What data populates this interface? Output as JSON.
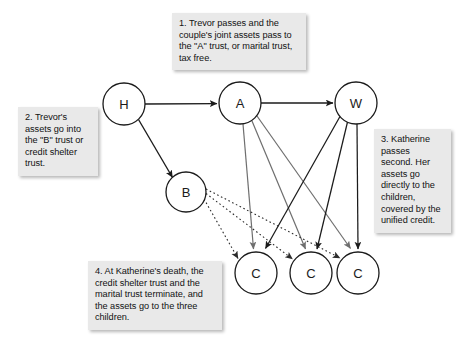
{
  "diagram": {
    "type": "flow-diagram",
    "background_color": "#ffffff",
    "node_fill": "#ffffff",
    "node_stroke": "#1b1b1b",
    "callout_fill": "#e9e9e9",
    "callout_text_color": "#121212",
    "nodes": [
      {
        "id": "H",
        "label": "H",
        "cx": 124,
        "cy": 104,
        "r": 21
      },
      {
        "id": "A",
        "label": "A",
        "cx": 240,
        "cy": 103,
        "r": 21
      },
      {
        "id": "W",
        "label": "W",
        "cx": 356,
        "cy": 103,
        "r": 21
      },
      {
        "id": "B",
        "label": "B",
        "cx": 186,
        "cy": 192,
        "r": 20
      },
      {
        "id": "C1",
        "label": "C",
        "cx": 256,
        "cy": 273,
        "r": 21
      },
      {
        "id": "C2",
        "label": "C",
        "cx": 311,
        "cy": 273,
        "r": 21
      },
      {
        "id": "C3",
        "label": "C",
        "cx": 358,
        "cy": 273,
        "r": 21
      }
    ],
    "edges": [
      {
        "from": "H",
        "to": "A",
        "style": "solid",
        "color": "#1b1b1b"
      },
      {
        "from": "A",
        "to": "W",
        "style": "solid",
        "color": "#1b1b1b"
      },
      {
        "from": "H",
        "to": "B",
        "style": "solid",
        "color": "#1b1b1b"
      },
      {
        "from": "A",
        "to": "C1",
        "style": "solid",
        "color": "#6e6e6e"
      },
      {
        "from": "A",
        "to": "C2",
        "style": "solid",
        "color": "#6e6e6e"
      },
      {
        "from": "A",
        "to": "C3",
        "style": "solid",
        "color": "#6e6e6e"
      },
      {
        "from": "W",
        "to": "C1",
        "style": "solid",
        "color": "#1b1b1b"
      },
      {
        "from": "W",
        "to": "C2",
        "style": "solid",
        "color": "#1b1b1b"
      },
      {
        "from": "W",
        "to": "C3",
        "style": "solid",
        "color": "#1b1b1b"
      },
      {
        "from": "B",
        "to": "C1",
        "style": "dotted",
        "color": "#4a4a4a"
      },
      {
        "from": "B",
        "to": "C2",
        "style": "dotted",
        "color": "#4a4a4a"
      },
      {
        "from": "B",
        "to": "C3",
        "style": "dotted",
        "color": "#4a4a4a"
      }
    ],
    "callouts": [
      {
        "id": "callout-1",
        "number": "1.",
        "text": "1.  Trevor passes and the couple's joint assets pass to the \"A\" trust, or marital trust, tax free."
      },
      {
        "id": "callout-2",
        "number": "2.",
        "text": "2.  Trevor's assets go into the \"B\" trust or credit shelter trust."
      },
      {
        "id": "callout-3",
        "number": "3.",
        "text": "3. Katherine passes second.  Her assets go directly to the children, covered by the unified credit."
      },
      {
        "id": "callout-4",
        "number": "4.",
        "text": "4. At Katherine's death, the credit shelter trust and the marital trust terminate, and the assets go to the three children."
      }
    ]
  }
}
